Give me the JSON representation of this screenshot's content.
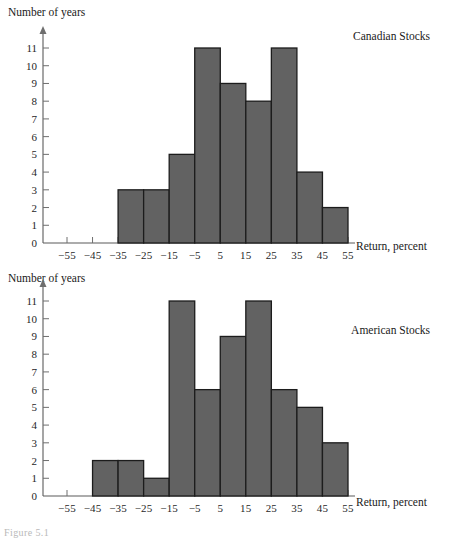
{
  "figure": {
    "caption_stub": "Figure 5.1"
  },
  "charts": [
    {
      "id": "canadian",
      "series_title": "Canadian Stocks",
      "ylabel": "Number of years",
      "xlabel": "Return, percent"
    },
    {
      "id": "american",
      "series_title": "American Stocks",
      "ylabel": "Number of years",
      "xlabel": "Return, percent"
    }
  ],
  "chart_data": [
    {
      "type": "bar",
      "title": "Canadian Stocks",
      "xlabel": "Return, percent",
      "ylabel": "Number of years",
      "bin_width": 10,
      "bin_edges": [
        -35,
        -25,
        -15,
        -5,
        5,
        15,
        25,
        35,
        45,
        55
      ],
      "categories": [
        "-35 to -25",
        "-25 to -15",
        "-15 to -5",
        "-5 to 5",
        "5 to 15",
        "15 to 25",
        "25 to 35",
        "35 to 45",
        "45 to 55"
      ],
      "values": [
        3,
        3,
        5,
        11,
        9,
        8,
        11,
        4,
        2
      ],
      "xticks": [
        -55,
        -45,
        -35,
        -25,
        -15,
        -5,
        5,
        15,
        25,
        35,
        45,
        55
      ],
      "xtick_labels": [
        "−55",
        "−45",
        "−35",
        "−25",
        "−15",
        "−5",
        "5",
        "15",
        "25",
        "35",
        "45",
        "55"
      ],
      "yticks": [
        0,
        1,
        2,
        3,
        4,
        5,
        6,
        7,
        8,
        9,
        10,
        11
      ],
      "ytick_labels": [
        "0",
        "1",
        "2",
        "3",
        "4",
        "5",
        "6",
        "7",
        "8",
        "9",
        "10",
        "11"
      ],
      "xlim": [
        -60,
        60
      ],
      "ylim": [
        0,
        11.8
      ],
      "grid": false,
      "legend": "none",
      "bar_fill": "#626262",
      "bar_stroke": "#1c1c1c"
    },
    {
      "type": "bar",
      "title": "American Stocks",
      "xlabel": "Return, percent",
      "ylabel": "Number of years",
      "bin_width": 10,
      "bin_edges": [
        -45,
        -35,
        -25,
        -15,
        -5,
        5,
        15,
        25,
        35,
        45,
        55
      ],
      "categories": [
        "-45 to -35",
        "-35 to -25",
        "-25 to -15",
        "-15 to -5",
        "-5 to 5",
        "5 to 15",
        "15 to 25",
        "25 to 35",
        "35 to 45",
        "45 to 55"
      ],
      "values": [
        2,
        2,
        1,
        11,
        6,
        9,
        11,
        6,
        5,
        3
      ],
      "xticks": [
        -55,
        -45,
        -35,
        -25,
        -15,
        -5,
        5,
        15,
        25,
        35,
        45,
        55
      ],
      "xtick_labels": [
        "−55",
        "−45",
        "−35",
        "−25",
        "−15",
        "−5",
        "5",
        "15",
        "25",
        "35",
        "45",
        "55"
      ],
      "yticks": [
        0,
        1,
        2,
        3,
        4,
        5,
        6,
        7,
        8,
        9,
        10,
        11
      ],
      "ytick_labels": [
        "0",
        "1",
        "2",
        "3",
        "4",
        "5",
        "6",
        "7",
        "8",
        "9",
        "10",
        "11"
      ],
      "xlim": [
        -60,
        60
      ],
      "ylim": [
        0,
        11.8
      ],
      "grid": false,
      "legend": "none",
      "bar_fill": "#626262",
      "bar_stroke": "#1c1c1c"
    }
  ]
}
